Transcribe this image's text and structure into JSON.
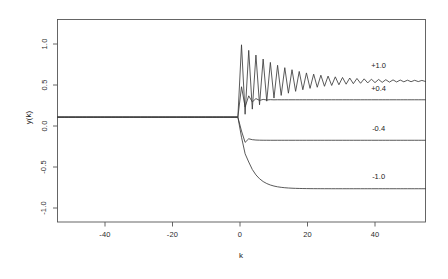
{
  "chart_data": {
    "type": "line",
    "title": "",
    "subtitle": "",
    "xlabel": "k",
    "ylabel": "y(k)",
    "xlim": [
      -51,
      51
    ],
    "ylim": [
      -1.45,
      1.35
    ],
    "xticks": [
      -40,
      -20,
      0,
      20,
      40
    ],
    "xtick_labels": [
      "-40",
      "-20",
      "0",
      "20",
      "40"
    ],
    "yticks": [
      1.0,
      0.5,
      0.0,
      -0.5,
      -1.0
    ],
    "ytick_labels": [
      "1.0",
      "0.5",
      "0.0",
      "-0.5",
      "-1.0"
    ],
    "grid": false,
    "legend_position": "inline-right",
    "line_color": "#3c3c3c",
    "axis_color": "#555555",
    "box": true,
    "series": [
      {
        "name": "+1.0",
        "label": "+1.0",
        "annotation": "+1.0",
        "steady_state": 0.5,
        "overshoot_peak": 1.0,
        "oscillatory": true,
        "oscillation_period_samples": 2,
        "decay_rate": 0.92,
        "annotation_x": 38,
        "annotation_y": 0.72
      },
      {
        "name": "+0.4",
        "label": "+0.4",
        "annotation": "+0.4",
        "steady_state": 0.24,
        "overshoot_peak": 0.42,
        "oscillatory": true,
        "oscillation_period_samples": 2,
        "decay_rate": 0.55,
        "annotation_x": 38,
        "annotation_y": 0.4
      },
      {
        "name": "-0.4",
        "label": "-0.4",
        "annotation": "-0.4",
        "steady_state": -0.32,
        "overshoot_peak": -0.4,
        "oscillatory": false,
        "decay_rate": 0.4,
        "annotation_x": 38,
        "annotation_y": -0.15
      },
      {
        "name": "-1.0",
        "label": "-1.0",
        "annotation": "-1.0",
        "steady_state": -0.99,
        "overshoot_peak": -1.02,
        "oscillatory": false,
        "decay_rate": 0.72,
        "annotation_x": 38,
        "annotation_y": -0.82
      }
    ],
    "zero_line_value": 0.0,
    "step_time": 0
  }
}
